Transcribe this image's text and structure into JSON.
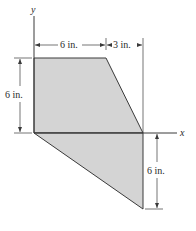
{
  "figure": {
    "type": "composite area cross-section",
    "axes": {
      "x_label": "x",
      "y_label": "y"
    },
    "dimensions": {
      "top_left_width": "6 in.",
      "top_right_width": "3 in.",
      "left_height": "6 in.",
      "right_height": "6 in."
    },
    "colors": {
      "fill": "#d4d4d4",
      "outline": "#3a3a3a",
      "dimension_line": "#3a3a3a",
      "background": "#ffffff"
    },
    "regions": [
      {
        "name": "upper-trapezoid",
        "vertices_in": [
          [
            0,
            0
          ],
          [
            0,
            6
          ],
          [
            6,
            6
          ],
          [
            9,
            0
          ]
        ]
      },
      {
        "name": "lower-triangle",
        "vertices_in": [
          [
            0,
            0
          ],
          [
            9,
            0
          ],
          [
            9,
            -6
          ]
        ]
      }
    ]
  }
}
